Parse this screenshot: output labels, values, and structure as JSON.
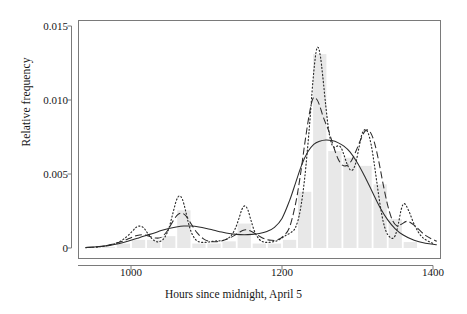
{
  "chart_data": {
    "type": "bar",
    "title": "",
    "subtitle": "",
    "xlabel": "Hours since midnight, April 5",
    "ylabel": "Relative frequency",
    "xlim": [
      940,
      1420
    ],
    "ylim": [
      0,
      0.0158
    ],
    "xticks": [
      1000,
      1200,
      1400
    ],
    "xtick_labels": [
      "1000",
      "1200",
      "1400"
    ],
    "yticks": [
      0,
      0.005,
      0.01,
      0.015
    ],
    "ytick_labels": [
      "0",
      "0.005",
      "0.010",
      "0.015"
    ],
    "grid": false,
    "legend": "none",
    "bar_color": "#e8e8e8",
    "line_color": "#2b2b2b",
    "frame_color": "#7a7a7a",
    "bar_width_hours": 20,
    "categories": [
      "960-980",
      "980-1000",
      "1000-1020",
      "1020-1040",
      "1040-1060",
      "1060-1080",
      "1080-1100",
      "1100-1120",
      "1120-1140",
      "1140-1160",
      "1160-1180",
      "1180-1200",
      "1200-1220",
      "1220-1240",
      "1240-1260",
      "1260-1280",
      "1280-1300",
      "1300-1320",
      "1320-1340",
      "1340-1360",
      "1360-1380"
    ],
    "bin_centers": [
      970,
      990,
      1010,
      1030,
      1050,
      1070,
      1090,
      1110,
      1130,
      1150,
      1170,
      1190,
      1210,
      1230,
      1250,
      1270,
      1290,
      1310,
      1330,
      1350,
      1370
    ],
    "values": [
      8e-05,
      0.0003,
      0.00055,
      0.00055,
      0.0008,
      0.00255,
      0.0003,
      0.0003,
      0.00045,
      0.00165,
      0.0003,
      0.0003,
      0.00055,
      0.0038,
      0.0131,
      0.00655,
      0.0061,
      0.00555,
      0.0043,
      0.00195,
      0.0004
    ],
    "series": [
      {
        "name": "oversmoothed kernel density",
        "style": "solid",
        "x": [
          940,
          955,
          970,
          985,
          1000,
          1010,
          1020,
          1030,
          1040,
          1050,
          1060,
          1070,
          1080,
          1090,
          1100,
          1110,
          1120,
          1130,
          1140,
          1150,
          1160,
          1170,
          1180,
          1190,
          1200,
          1210,
          1218,
          1226,
          1234,
          1242,
          1250,
          1258,
          1266,
          1274,
          1282,
          1290,
          1300,
          1310,
          1320,
          1330,
          1340,
          1350,
          1360,
          1375,
          1390,
          1405,
          1420
        ],
        "y": [
          4e-05,
          8e-05,
          0.00016,
          0.0003,
          0.00052,
          0.00068,
          0.00085,
          0.001,
          0.00118,
          0.00132,
          0.00142,
          0.00148,
          0.00148,
          0.00142,
          0.00132,
          0.0012,
          0.00108,
          0.00098,
          0.00092,
          0.0009,
          0.00092,
          0.00098,
          0.00112,
          0.0014,
          0.002,
          0.0032,
          0.0044,
          0.0056,
          0.00648,
          0.007,
          0.00722,
          0.0073,
          0.00726,
          0.00712,
          0.00688,
          0.0065,
          0.00575,
          0.0048,
          0.00375,
          0.00272,
          0.0019,
          0.0013,
          0.0009,
          0.00052,
          0.00032,
          0.00022,
          0.00018
        ]
      },
      {
        "name": "cross-validated kernel density",
        "style": "dashed",
        "x": [
          940,
          960,
          975,
          990,
          1000,
          1008,
          1016,
          1024,
          1032,
          1040,
          1048,
          1056,
          1062,
          1068,
          1074,
          1080,
          1088,
          1096,
          1104,
          1112,
          1120,
          1128,
          1136,
          1144,
          1150,
          1156,
          1162,
          1170,
          1178,
          1186,
          1194,
          1202,
          1210,
          1218,
          1224,
          1230,
          1236,
          1241,
          1246,
          1250,
          1254,
          1258,
          1262,
          1268,
          1274,
          1280,
          1286,
          1292,
          1298,
          1304,
          1310,
          1316,
          1322,
          1328,
          1334,
          1340,
          1346,
          1352,
          1358,
          1366,
          1376,
          1390,
          1405,
          1420
        ],
        "y": [
          3e-05,
          0.0001,
          0.00025,
          0.00048,
          0.0007,
          0.00085,
          0.0009,
          0.0008,
          0.00068,
          0.00072,
          0.00115,
          0.00185,
          0.00225,
          0.00235,
          0.0021,
          0.0016,
          0.001,
          0.00062,
          0.00045,
          0.00042,
          0.00048,
          0.00062,
          0.00082,
          0.00108,
          0.00122,
          0.0012,
          0.00105,
          0.0008,
          0.0006,
          0.00052,
          0.00055,
          0.00082,
          0.0014,
          0.003,
          0.0048,
          0.007,
          0.009,
          0.0101,
          0.01005,
          0.0096,
          0.00895,
          0.0084,
          0.0079,
          0.0069,
          0.00605,
          0.0056,
          0.00558,
          0.0059,
          0.00655,
          0.0073,
          0.0079,
          0.0079,
          0.0072,
          0.0059,
          0.0043,
          0.00288,
          0.0019,
          0.0015,
          0.0016,
          0.0018,
          0.0015,
          0.00085,
          0.00045,
          0.00025
        ]
      },
      {
        "name": "undersmoothed kernel density",
        "style": "dotted",
        "x": [
          940,
          958,
          972,
          984,
          994,
          1002,
          1007,
          1012,
          1017,
          1022,
          1028,
          1034,
          1040,
          1045,
          1050,
          1055,
          1060,
          1064,
          1068,
          1072,
          1076,
          1080,
          1085,
          1090,
          1096,
          1102,
          1108,
          1114,
          1120,
          1126,
          1132,
          1138,
          1143,
          1147,
          1151,
          1155,
          1159,
          1164,
          1170,
          1176,
          1182,
          1188,
          1194,
          1200,
          1206,
          1212,
          1218,
          1224,
          1230,
          1236,
          1241,
          1245,
          1248,
          1251,
          1254,
          1258,
          1262,
          1266,
          1270,
          1274,
          1278,
          1282,
          1286,
          1290,
          1294,
          1298,
          1302,
          1306,
          1310,
          1314,
          1318,
          1322,
          1326,
          1330,
          1334,
          1338,
          1342,
          1346,
          1350,
          1354,
          1358,
          1362,
          1368,
          1376,
          1386,
          1400,
          1415
        ],
        "y": [
          2e-05,
          8e-05,
          0.0002,
          0.0004,
          0.00075,
          0.00115,
          0.0014,
          0.00148,
          0.00135,
          0.001,
          0.00062,
          0.00042,
          0.00048,
          0.00075,
          0.0013,
          0.00225,
          0.0032,
          0.00352,
          0.0033,
          0.00258,
          0.0017,
          0.00105,
          0.0006,
          0.00042,
          0.00038,
          0.0004,
          0.00045,
          0.00048,
          0.0005,
          0.00058,
          0.0008,
          0.0013,
          0.002,
          0.00262,
          0.00285,
          0.00255,
          0.00185,
          0.00108,
          0.00058,
          0.0004,
          0.00038,
          0.00042,
          0.0005,
          0.00068,
          0.00088,
          0.00105,
          0.0014,
          0.0025,
          0.0047,
          0.008,
          0.0113,
          0.0132,
          0.01355,
          0.0129,
          0.0116,
          0.0096,
          0.0079,
          0.007,
          0.0068,
          0.0069,
          0.0068,
          0.0063,
          0.0057,
          0.0053,
          0.0053,
          0.0058,
          0.0068,
          0.0077,
          0.008,
          0.00778,
          0.007,
          0.00575,
          0.0043,
          0.0029,
          0.0018,
          0.0011,
          0.00078,
          0.00065,
          0.00085,
          0.0016,
          0.00262,
          0.003,
          0.0025,
          0.0015,
          0.00072,
          0.0003,
          0.00014
        ]
      }
    ]
  },
  "axes": {
    "ylabel": "Relative frequency",
    "xlabel": "Hours since midnight, April 5",
    "ytick_labels": [
      "0",
      "0.005",
      "0.010",
      "0.015"
    ],
    "xtick_labels": [
      "1000",
      "1200",
      "1400"
    ]
  }
}
